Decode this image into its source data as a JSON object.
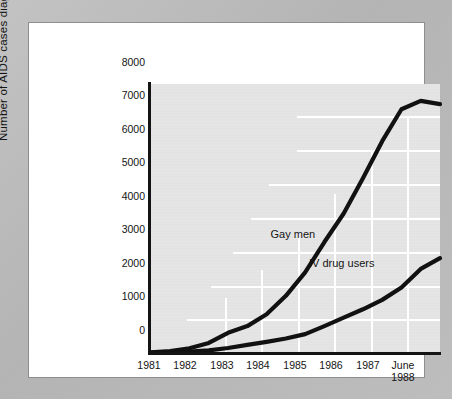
{
  "figure": {
    "background_color": "#b9b9b9",
    "panel_color": "#ffffff",
    "plot_color": "#e3e3e3",
    "line_color": "#111111",
    "grid_color": "#ffffff"
  },
  "chart_data": {
    "type": "line",
    "title": "",
    "subtitle": "",
    "xlabel": "",
    "ylabel": "Number of AIDS cases diagnosed",
    "ylim": [
      0,
      8000
    ],
    "xlim": [
      "1981",
      "June 1988"
    ],
    "yticks": [
      "0",
      "1000",
      "2000",
      "3000",
      "4000",
      "5000",
      "6000",
      "7000",
      "8000"
    ],
    "ytick_values": [
      0,
      1000,
      2000,
      3000,
      4000,
      5000,
      6000,
      7000,
      8000
    ],
    "xticks": [
      "1981",
      "1982",
      "1983",
      "1984",
      "1985",
      "1986",
      "1987",
      "June\n1988"
    ],
    "xtick_values": [
      1981,
      1982,
      1983,
      1984,
      1985,
      1986,
      1987,
      1988.5
    ],
    "grid": "partial-white-grid",
    "legend_position": "inline-annotations",
    "series": [
      {
        "name": "Gay men",
        "x": [
          1981,
          1981.5,
          1982,
          1982.5,
          1983,
          1983.5,
          1984,
          1984.5,
          1985,
          1985.5,
          1986,
          1986.5,
          1987,
          1987.5,
          1988,
          1988.5
        ],
        "values": [
          20,
          60,
          140,
          300,
          600,
          800,
          1150,
          1700,
          2400,
          3300,
          4150,
          5200,
          6300,
          7250,
          7500,
          7400
        ],
        "label_x": 1984.1,
        "label_y": 3500
      },
      {
        "name": "IV drug users",
        "x": [
          1981,
          1981.5,
          1982,
          1982.5,
          1983,
          1983.5,
          1984,
          1984.5,
          1985,
          1985.5,
          1986,
          1986.5,
          1987,
          1987.5,
          1988,
          1988.5
        ],
        "values": [
          10,
          20,
          40,
          80,
          150,
          240,
          330,
          430,
          560,
          800,
          1050,
          1300,
          1580,
          1950,
          2500,
          2820
        ],
        "label_x": 1985.1,
        "label_y": 2650
      }
    ]
  },
  "annotations": {
    "gay_men": "Gay men",
    "iv_drug_users": "IV drug users"
  }
}
